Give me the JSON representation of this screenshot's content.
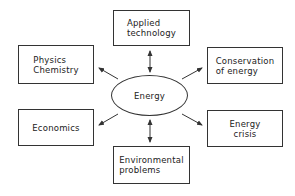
{
  "diagram": {
    "center": {
      "label": "Energy"
    },
    "nodes": [
      {
        "id": "applied-technology",
        "label": "Applied\ntechnology",
        "relation": "bidirectional"
      },
      {
        "id": "physics-chemistry",
        "label": "Physics\nChemistry",
        "relation": "outgoing"
      },
      {
        "id": "conservation-of-energy",
        "label": "Conservation\nof  energy",
        "relation": "outgoing"
      },
      {
        "id": "economics",
        "label": "Economics",
        "relation": "outgoing"
      },
      {
        "id": "energy-crisis",
        "label": "Energy\ncrisis",
        "relation": "outgoing"
      },
      {
        "id": "environmental-problems",
        "label": "Environmental\nproblems",
        "relation": "bidirectional"
      }
    ],
    "colors": {
      "stroke": "#333333",
      "background": "#ffffff",
      "text": "#222222"
    }
  }
}
